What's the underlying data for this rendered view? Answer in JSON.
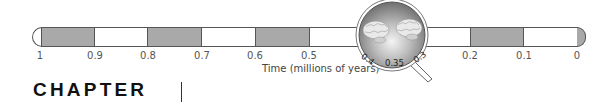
{
  "timeline": {
    "axis_title": "Time (millions of years)",
    "ticks": [
      "1",
      "0.9",
      "0.8",
      "0.7",
      "0.6",
      "0.5",
      "0.4",
      "0.3",
      "0.2",
      "0.1",
      "0"
    ],
    "segments": [
      {
        "from": "1",
        "to": "0.9",
        "fill": "shaded"
      },
      {
        "from": "0.9",
        "to": "0.8",
        "fill": "plain"
      },
      {
        "from": "0.8",
        "to": "0.7",
        "fill": "shaded"
      },
      {
        "from": "0.7",
        "to": "0.6",
        "fill": "plain"
      },
      {
        "from": "0.6",
        "to": "0.5",
        "fill": "shaded"
      },
      {
        "from": "0.5",
        "to": "0.4",
        "fill": "plain"
      },
      {
        "from": "0.4",
        "to": "0.3",
        "fill": "magnified"
      },
      {
        "from": "0.3",
        "to": "0.2",
        "fill": "plain"
      },
      {
        "from": "0.2",
        "to": "0.1",
        "fill": "shaded"
      },
      {
        "from": "0.1",
        "to": "0",
        "fill": "plain"
      }
    ],
    "colors": {
      "shaded": "#a9a9a9",
      "border": "#555555"
    }
  },
  "magnifier": {
    "icon": "magnifying-glass-icon",
    "content": "two-brain-illustrations",
    "labels": {
      "left": "0.4",
      "center": "0.35",
      "right": "0.3"
    }
  },
  "heading": {
    "word": "CHAPTER",
    "number": "|"
  }
}
